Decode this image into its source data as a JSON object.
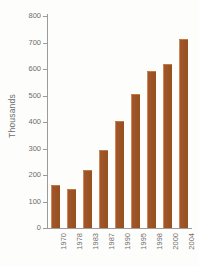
{
  "chart_data": {
    "type": "bar",
    "title": "",
    "subtitle": "",
    "xlabel": "",
    "ylabel": "Thousands",
    "categories": [
      "1970",
      "1978",
      "1983",
      "1987",
      "1990",
      "1995",
      "1998",
      "2000",
      "2004"
    ],
    "values": [
      162,
      147,
      220,
      295,
      405,
      505,
      592,
      618,
      712
    ],
    "ylim": [
      0,
      800
    ],
    "y_ticks": [
      0,
      100,
      200,
      300,
      400,
      500,
      600,
      700,
      800
    ],
    "y_tick_labels": [
      "0",
      "100",
      "200",
      "300",
      "400",
      "500",
      "600",
      "700",
      "800"
    ],
    "grid": false,
    "legend": null,
    "legend_position": "none",
    "series": [
      {
        "name": "Thousands",
        "values": [
          162,
          147,
          220,
          295,
          405,
          505,
          592,
          618,
          712
        ]
      }
    ],
    "colors": {
      "bar_fill": "#a2562a",
      "bar_highlight": "#c9895c",
      "axis": "#9b9b9b",
      "text": "#6d6d6d",
      "background": "#fdfdfb"
    }
  }
}
